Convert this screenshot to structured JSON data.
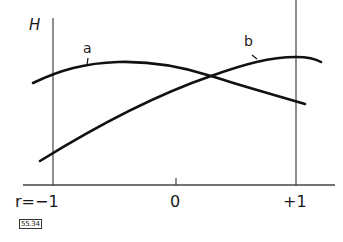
{
  "diagram": {
    "y_axis_label": "H",
    "x_axis": {
      "variable": "r",
      "ticks": [
        {
          "label": "r=−1",
          "value": -1
        },
        {
          "label": "0",
          "value": 0
        },
        {
          "label": "+1",
          "value": 1
        }
      ]
    },
    "curves": [
      {
        "name": "a",
        "label": "a",
        "shape": "concave, peaks left of center near r≈-0.4, decreases toward r=+1"
      },
      {
        "name": "b",
        "label": "b",
        "shape": "rising from low at r=-1, peaks near r=+1"
      }
    ],
    "figure_id": "55.34",
    "colors": {
      "line": "#111111",
      "background": "#ffffff"
    }
  }
}
